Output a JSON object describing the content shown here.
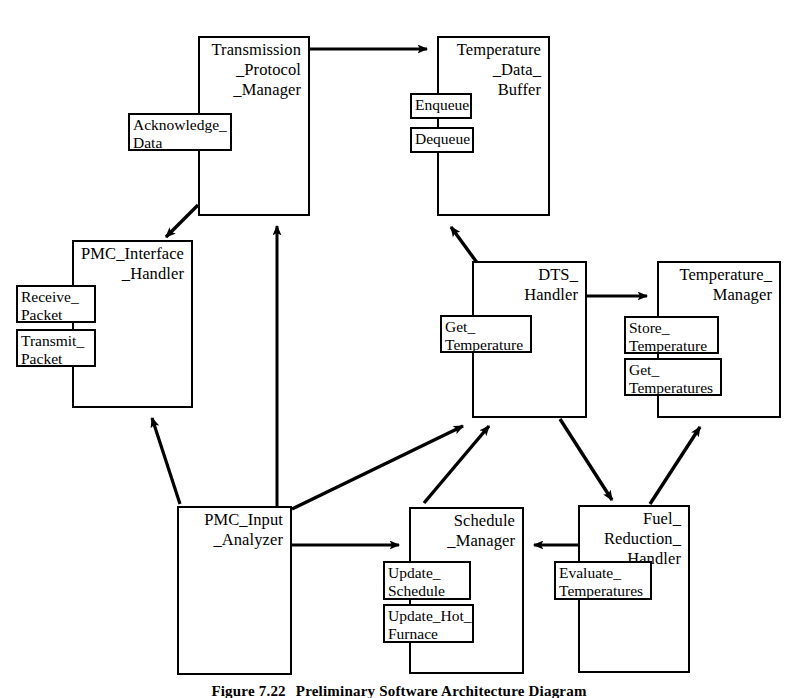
{
  "figure": {
    "number": "Figure 7.22",
    "title": "Preliminary Software Architecture Diagram",
    "caption_visible_fragment": "Figure 7.22   Preliminary Software Architecture Diagram"
  },
  "diagram": {
    "type": "software-architecture-task-diagram",
    "stroke_color": "#000000",
    "fill_color": "#ffffff",
    "components": [
      {
        "id": "transmission-protocol-manager",
        "name": "Transmission\n_Protocol\n_Manager",
        "x": 198,
        "y": 36,
        "w": 112,
        "h": 180,
        "operations": [
          {
            "id": "acknowledge-data",
            "name": "Acknowledge_\nData",
            "x": 128,
            "y": 113,
            "w": 104,
            "h": 38
          }
        ]
      },
      {
        "id": "temperature-data-buffer",
        "name": "Temperature\n_Data_\nBuffer",
        "x": 437,
        "y": 36,
        "w": 113,
        "h": 180,
        "operations": [
          {
            "id": "enqueue",
            "name": "Enqueue",
            "x": 410,
            "y": 93,
            "w": 62,
            "h": 26
          },
          {
            "id": "dequeue",
            "name": "Dequeue",
            "x": 410,
            "y": 127,
            "w": 64,
            "h": 26
          }
        ]
      },
      {
        "id": "pmc-interface-handler",
        "name": "PMC_Interface\n_Handler",
        "x": 72,
        "y": 240,
        "w": 121,
        "h": 168,
        "operations": [
          {
            "id": "receive-packet",
            "name": "Receive_\nPacket",
            "x": 16,
            "y": 285,
            "w": 80,
            "h": 38
          },
          {
            "id": "transmit-packet",
            "name": "Transmit_\nPacket",
            "x": 16,
            "y": 329,
            "w": 80,
            "h": 38
          }
        ]
      },
      {
        "id": "dts-handler",
        "name": "DTS_\nHandler",
        "x": 472,
        "y": 261,
        "w": 115,
        "h": 157,
        "operations": [
          {
            "id": "get-temperature",
            "name": "Get_\nTemperature",
            "x": 440,
            "y": 315,
            "w": 92,
            "h": 38
          }
        ]
      },
      {
        "id": "temperature-manager",
        "name": "Temperature_\nManager",
        "x": 657,
        "y": 261,
        "w": 124,
        "h": 157,
        "operations": [
          {
            "id": "store-temperature",
            "name": "Store_\nTemperature",
            "x": 624,
            "y": 316,
            "w": 95,
            "h": 38
          },
          {
            "id": "get-temperatures",
            "name": "Get_\nTemperatures",
            "x": 624,
            "y": 358,
            "w": 98,
            "h": 38
          }
        ]
      },
      {
        "id": "pmc-input-analyzer",
        "name": "PMC_Input\n_Analyzer",
        "x": 177,
        "y": 506,
        "w": 115,
        "h": 169,
        "operations": []
      },
      {
        "id": "schedule-manager",
        "name": "Schedule\n_Manager",
        "x": 409,
        "y": 507,
        "w": 115,
        "h": 167,
        "operations": [
          {
            "id": "update-schedule",
            "name": "Update_\nSchedule",
            "x": 383,
            "y": 561,
            "w": 88,
            "h": 39
          },
          {
            "id": "update-hot-furnace",
            "name": "Update_Hot_\nFurnace",
            "x": 383,
            "y": 604,
            "w": 91,
            "h": 39
          }
        ]
      },
      {
        "id": "fuel-reduction-handler",
        "name": "Fuel_\nReduction_\nHandler",
        "x": 578,
        "y": 505,
        "w": 112,
        "h": 168,
        "operations": [
          {
            "id": "evaluate-temperatures",
            "name": "Evaluate_\nTemperatures",
            "x": 554,
            "y": 561,
            "w": 98,
            "h": 39
          }
        ]
      }
    ],
    "connections": [
      {
        "id": "tpm-to-tdb",
        "from": "transmission-protocol-manager",
        "to": "temperature-data-buffer",
        "style": "solid-arrow"
      },
      {
        "id": "tpm-to-pih",
        "from": "transmission-protocol-manager",
        "to": "pmc-interface-handler",
        "style": "solid-arrow"
      },
      {
        "id": "pia-to-tpm",
        "from": "pmc-input-analyzer",
        "to": "transmission-protocol-manager",
        "style": "solid-arrow"
      },
      {
        "id": "pia-to-pih",
        "from": "pmc-input-analyzer",
        "to": "pmc-interface-handler",
        "style": "solid-arrow"
      },
      {
        "id": "dts-to-tdb",
        "from": "dts-handler",
        "to": "temperature-data-buffer",
        "style": "solid-arrow"
      },
      {
        "id": "dts-to-tm",
        "from": "dts-handler",
        "to": "temperature-manager",
        "style": "solid-arrow"
      },
      {
        "id": "dts-to-frh",
        "from": "dts-handler",
        "to": "fuel-reduction-handler",
        "style": "solid-arrow"
      },
      {
        "id": "pia-to-dts",
        "from": "pmc-input-analyzer",
        "to": "dts-handler",
        "style": "solid-arrow"
      },
      {
        "id": "pia-to-sm",
        "from": "pmc-input-analyzer",
        "to": "schedule-manager",
        "style": "solid-arrow"
      },
      {
        "id": "sm-to-dts",
        "from": "schedule-manager",
        "to": "dts-handler",
        "style": "solid-arrow"
      },
      {
        "id": "frh-to-sm",
        "from": "fuel-reduction-handler",
        "to": "schedule-manager",
        "style": "solid-arrow"
      },
      {
        "id": "frh-to-tm",
        "from": "fuel-reduction-handler",
        "to": "temperature-manager",
        "style": "solid-arrow"
      }
    ]
  }
}
